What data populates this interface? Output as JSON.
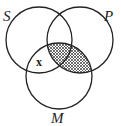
{
  "diagram": {
    "type": "venn-3",
    "circles": [
      {
        "label": "S",
        "cx": 39,
        "cy": 40,
        "r": 33
      },
      {
        "label": "P",
        "cx": 80,
        "cy": 40,
        "r": 33
      },
      {
        "label": "M",
        "cx": 59,
        "cy": 76,
        "r": 33
      }
    ],
    "labels": {
      "s": "S",
      "p": "P",
      "m": "M",
      "x_mark": "x"
    },
    "shaded_region": "P ∩ M",
    "x_mark_region": "S ∩ M outside P",
    "colors": {
      "stroke": "#222222",
      "hatch": "#333333",
      "background": "#ffffff"
    }
  }
}
